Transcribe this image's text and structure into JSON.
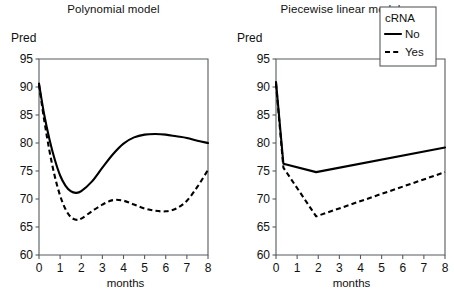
{
  "figure": {
    "background": "#ffffff",
    "foreground": "#111111",
    "axis_color": "#555b5e"
  },
  "panels": [
    {
      "id": "polynomial",
      "title": "Polynomial model",
      "ylabel": "Pred",
      "xlabel": "months"
    },
    {
      "id": "piecewise",
      "title": "Piecewise linear model",
      "ylabel": "Pred",
      "xlabel": "months"
    }
  ],
  "legend": {
    "title": "cRNA",
    "position": "top-right-of-right-panel",
    "entries": [
      {
        "label": "No",
        "style": "solid"
      },
      {
        "label": "Yes",
        "style": "dashed"
      }
    ]
  },
  "axes": {
    "y_ticks": [
      "60",
      "65",
      "70",
      "75",
      "80",
      "85",
      "90",
      "95"
    ],
    "x_ticks": [
      "0",
      "1",
      "2",
      "3",
      "4",
      "5",
      "6",
      "7",
      "8"
    ],
    "ylim": [
      60,
      95
    ],
    "xlim": [
      0,
      8
    ],
    "grid": false
  },
  "chart_data": [
    {
      "type": "line",
      "title": "Polynomial model",
      "xlabel": "months",
      "ylabel": "Pred",
      "xlim": [
        0,
        8
      ],
      "ylim": [
        60,
        95
      ],
      "grid": false,
      "legend_title": "cRNA",
      "legend_position": "none",
      "x": [
        0,
        0.25,
        0.5,
        0.75,
        1,
        1.25,
        1.5,
        1.75,
        2,
        2.5,
        3,
        3.5,
        4,
        4.5,
        5,
        5.5,
        6,
        6.5,
        7,
        7.5,
        8
      ],
      "series": [
        {
          "name": "No",
          "style": "solid",
          "values": [
            90.6,
            85.0,
            80.6,
            77.0,
            74.2,
            72.4,
            71.4,
            71.1,
            71.4,
            73.1,
            75.6,
            78.0,
            79.9,
            81.0,
            81.5,
            81.6,
            81.5,
            81.2,
            80.9,
            80.4,
            80.0
          ]
        },
        {
          "name": "Yes",
          "style": "dashed",
          "values": [
            90.4,
            84.0,
            78.5,
            74.0,
            70.6,
            68.2,
            66.8,
            66.3,
            66.5,
            67.8,
            69.0,
            69.8,
            69.7,
            69.0,
            68.3,
            67.9,
            67.8,
            68.3,
            69.7,
            72.2,
            75.2
          ]
        }
      ]
    },
    {
      "type": "line",
      "title": "Piecewise linear model",
      "xlabel": "months",
      "ylabel": "Pred",
      "xlim": [
        0,
        8
      ],
      "ylim": [
        60,
        95
      ],
      "grid": false,
      "legend_title": "cRNA",
      "legend_position": "upper right",
      "breakpoints": [
        0.35,
        1.9
      ],
      "series": [
        {
          "name": "No",
          "style": "solid",
          "x": [
            0,
            0.35,
            1.9,
            8
          ],
          "values": [
            90.9,
            76.3,
            74.8,
            79.2
          ]
        },
        {
          "name": "Yes",
          "style": "dashed",
          "x": [
            0,
            0.35,
            1.9,
            8
          ],
          "values": [
            90.6,
            75.6,
            66.9,
            74.8
          ]
        }
      ]
    }
  ]
}
